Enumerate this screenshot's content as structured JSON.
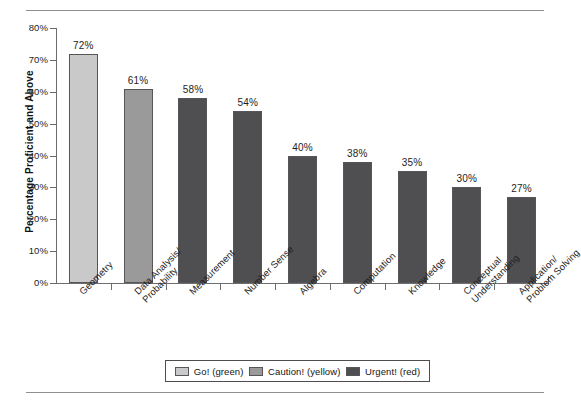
{
  "chart_data": {
    "type": "bar",
    "title": "",
    "xlabel": "",
    "ylabel": "Percentage Proficient and Above",
    "ylim": [
      0,
      80
    ],
    "grid": false,
    "legend_position": "bottom",
    "categories": [
      "Geometry",
      "Data Analysis/\nProbability",
      "Measurement",
      "Number Sense",
      "Algebra",
      "Computation",
      "Knowledge",
      "Conceptual\nUnderstanding",
      "Application/\nProblem Solving"
    ],
    "values": [
      72,
      61,
      58,
      54,
      40,
      38,
      35,
      30,
      27
    ],
    "point_labels": [
      "72%",
      "61%",
      "58%",
      "54%",
      "40%",
      "38%",
      "35%",
      "30%",
      "27%"
    ],
    "series_by_point": [
      "go",
      "caution",
      "urgent",
      "urgent",
      "urgent",
      "urgent",
      "urgent",
      "urgent",
      "urgent"
    ],
    "ytick_labels": [
      "80%",
      "70%",
      "60%",
      "50%",
      "40%",
      "30%",
      "20%",
      "10%",
      "0%"
    ],
    "ytick_values": [
      80,
      70,
      60,
      50,
      40,
      30,
      20,
      10,
      0
    ],
    "legend": [
      {
        "key": "go",
        "label": "Go! (green)",
        "swatch_hex": "#c9c9c9"
      },
      {
        "key": "caution",
        "label": "Caution! (yellow)",
        "swatch_hex": "#9a9a9a"
      },
      {
        "key": "urgent",
        "label": "Urgent! (red)",
        "swatch_hex": "#4f4f52"
      }
    ],
    "bar_categories_wrapped": [
      [
        "Geometry"
      ],
      [
        "Data Analysis/",
        "Probability"
      ],
      [
        "Measurement"
      ],
      [
        "Number Sense"
      ],
      [
        "Algebra"
      ],
      [
        "Computation"
      ],
      [
        "Knowledge"
      ],
      [
        "Conceptual",
        "Understanding"
      ],
      [
        "Application/",
        "Problem Solving"
      ]
    ]
  }
}
